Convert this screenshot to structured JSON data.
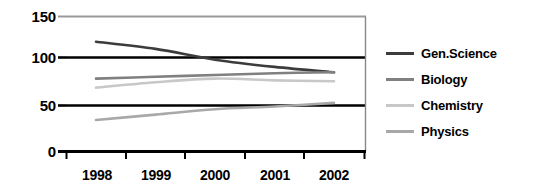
{
  "chart_data": {
    "type": "line",
    "title": "",
    "subtitle": "",
    "xlabel": "",
    "ylabel": "",
    "categories": [
      "1998",
      "1999",
      "2000",
      "2001",
      "2002"
    ],
    "x_tick_labels": [
      "1998",
      "1999",
      "2000",
      "2001",
      "2002"
    ],
    "y_tick_labels": [
      "0",
      "50",
      "100",
      "150"
    ],
    "y_ticks": [
      0,
      50,
      100,
      150
    ],
    "ylim": [
      0,
      150
    ],
    "grid": true,
    "grid_axis": "y",
    "legend_position": "right",
    "series": [
      {
        "name": "Gen.Science",
        "color": "#3c3c3c",
        "values": [
          122,
          114,
          102,
          94,
          88
        ]
      },
      {
        "name": "Biology",
        "color": "#808080",
        "values": [
          81,
          83,
          85,
          87,
          88
        ]
      },
      {
        "name": "Chemistry",
        "color": "#c8c8c8",
        "values": [
          71,
          77,
          81,
          79,
          78
        ]
      },
      {
        "name": "Physics",
        "color": "#a8a8a8",
        "values": [
          35,
          41,
          47,
          50,
          54
        ]
      }
    ]
  },
  "legend": {
    "items": [
      {
        "label": "Gen.Science",
        "swatch_color": "#3c3c3c",
        "icon": "line-swatch-icon"
      },
      {
        "label": "Biology",
        "swatch_color": "#808080",
        "icon": "line-swatch-icon"
      },
      {
        "label": "Chemistry",
        "swatch_color": "#c8c8c8",
        "icon": "line-swatch-icon"
      },
      {
        "label": "Physics",
        "swatch_color": "#a8a8a8",
        "icon": "line-swatch-icon"
      }
    ]
  },
  "axes": {
    "colors": {
      "axis_line": "#000000",
      "gridline_major": "#000000",
      "gridline_top": "#999999",
      "tick_mark": "#000000"
    }
  }
}
